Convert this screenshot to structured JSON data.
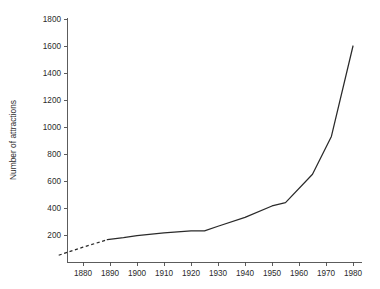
{
  "chart_data": {
    "type": "line",
    "title": "",
    "subtitle": "",
    "xlabel": "",
    "ylabel": "Number of attractions",
    "xlim": [
      1871,
      1982
    ],
    "ylim": [
      0,
      1800
    ],
    "grid": false,
    "legend": null,
    "x_ticks": [
      1880,
      1890,
      1900,
      1910,
      1920,
      1930,
      1940,
      1950,
      1960,
      1970,
      1980
    ],
    "x_tick_labels": [
      "1880",
      "1890",
      "1900",
      "1910",
      "1920",
      "1930",
      "1940",
      "1950",
      "1960",
      "1970",
      "1980"
    ],
    "y_ticks": [
      200,
      400,
      600,
      800,
      1000,
      1200,
      1400,
      1600,
      1800
    ],
    "y_tick_labels": [
      "200",
      "400",
      "600",
      "800",
      "1000",
      "1200",
      "1400",
      "1600",
      "1800"
    ],
    "series": [
      {
        "name": "Number of attractions",
        "style": "dashed",
        "note": "estimated / extrapolated early segment",
        "color": "#2a2a2a",
        "x": [
          1871,
          1880,
          1889
        ],
        "values": [
          50,
          110,
          165
        ]
      },
      {
        "name": "Number of attractions",
        "style": "solid",
        "note": "observed segment",
        "color": "#2a2a2a",
        "x": [
          1889,
          1895,
          1900,
          1910,
          1920,
          1925,
          1930,
          1940,
          1950,
          1955,
          1965,
          1972,
          1980
        ],
        "values": [
          165,
          180,
          195,
          215,
          230,
          230,
          265,
          330,
          415,
          440,
          650,
          930,
          1600
        ]
      }
    ]
  },
  "axes": {
    "y_axis_title": "Number of attractions"
  }
}
